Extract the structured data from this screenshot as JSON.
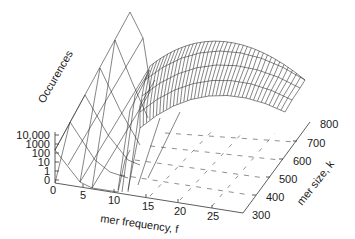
{
  "chart_data": {
    "type": "surface3d",
    "title": "",
    "zlabel": "Occurences",
    "xlabel": "mer frequency, f",
    "ylabel": "mer size, k",
    "x_ticks": [
      "0",
      "5",
      "10",
      "15",
      "20",
      "25"
    ],
    "y_ticks": [
      "300",
      "400",
      "500",
      "600",
      "700",
      "800"
    ],
    "z_ticks": [
      "0",
      "1",
      "10",
      "100",
      "1000",
      "10,000"
    ],
    "z_scale": "log",
    "xlim": [
      0,
      28
    ],
    "ylim": [
      300,
      800
    ],
    "series": [
      {
        "name": "low-frequency region (f 0-10)",
        "x": [
          0,
          2,
          4,
          6,
          8,
          10
        ],
        "approx_log10_values": [
          4.6,
          4.2,
          3.6,
          2.6,
          1.6,
          1.0
        ]
      },
      {
        "name": "coverage peak (f 12-28)",
        "x": [
          12,
          14,
          16,
          18,
          20,
          22,
          24,
          26,
          28
        ],
        "approx_log10_values": [
          2.5,
          3.2,
          3.5,
          3.6,
          3.5,
          3.3,
          3.0,
          2.7,
          2.4
        ]
      }
    ]
  }
}
